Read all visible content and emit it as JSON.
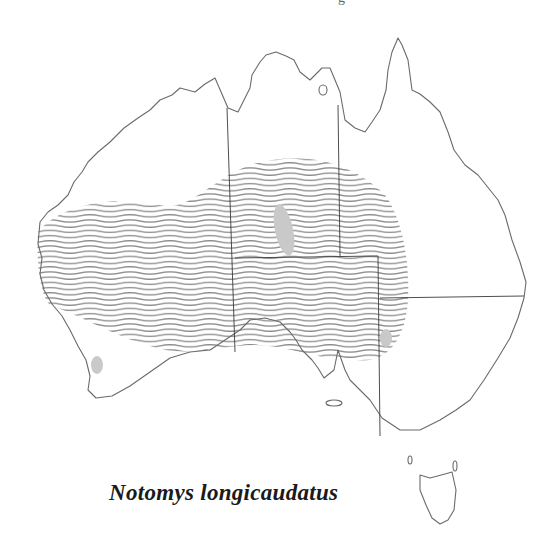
{
  "map": {
    "region": "Australia",
    "title_fragment": "g",
    "caption": "Notomys longicaudatus",
    "legend": {
      "hatched_area": "historical distribution (range)",
      "gray_patches": "recent / current records"
    },
    "colors": {
      "coastline": "#6a6a6a",
      "state_borders": "#3a3a3a",
      "hatching": "#8a8a8a",
      "patches": "#c9c9c9",
      "background": "#ffffff"
    },
    "patches": [
      {
        "name": "central-australia-patch",
        "cx": 284,
        "cy": 230
      },
      {
        "name": "nsw-border-patch",
        "cx": 386,
        "cy": 338
      },
      {
        "name": "southwest-wa-patch",
        "cx": 97,
        "cy": 365
      }
    ]
  }
}
